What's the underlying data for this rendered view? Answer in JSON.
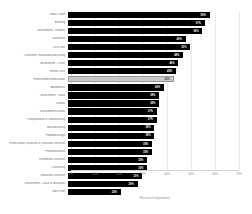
{
  "chart_data": {
    "type": "bar",
    "orientation": "horizontal",
    "title": "",
    "xlabel": "Percent of respondents",
    "ylabel": "",
    "xlim": [
      0,
      70
    ],
    "grid": true,
    "legend": false,
    "xticks": [
      "0%",
      "10%",
      "20%",
      "30%",
      "40%",
      "50%",
      "60%",
      "70%"
    ],
    "xtick_values": [
      0,
      10,
      20,
      30,
      40,
      50,
      60,
      70
    ],
    "categories": [
      "Retail Trade",
      "Banking",
      "Government - Federal",
      "Insurance",
      "Oil & Gas",
      "Consumer Goods/Manufacturing",
      "Government - Other",
      "Health Care",
      "Entertainment/Education",
      "Automotive",
      "Government - State",
      "Utilities",
      "Telecommunications",
      "Transportation & Warehousing",
      "Manufacturing",
      "Food/Beverage",
      "Professional, Scientific & Technical Services",
      "Pharmaceutical",
      "Information Services",
      "Consulting",
      "Education Services",
      "Government - Local & Municipal",
      "Non-Profit"
    ],
    "values": [
      59,
      57,
      56,
      49,
      51,
      48,
      46,
      45,
      44,
      40,
      38,
      38,
      37,
      37,
      36,
      36,
      35,
      35,
      33,
      33,
      31,
      29,
      22
    ],
    "value_labels": [
      "59%",
      "57%",
      "56%",
      "49%",
      "51%",
      "48%",
      "46%",
      "45%",
      "44%",
      "40%",
      "38%",
      "38%",
      "37%",
      "37%",
      "36%",
      "36%",
      "35%",
      "35%",
      "33%",
      "33%",
      "31%",
      "29%",
      "22%"
    ],
    "highlight_index": 8,
    "colors": {
      "bar": "#000000",
      "bar_highlight": "#c9c9c9",
      "bar_highlight_border": "#9a9a9a",
      "value_text": "#ffffff",
      "value_text_highlight": "#4a4a4a",
      "category_text": "#6d6d6d",
      "tick_text": "#8a8a8a",
      "gridline": "#e8e8e8",
      "axis": "#d5d5d5",
      "background": "#ffffff"
    }
  }
}
